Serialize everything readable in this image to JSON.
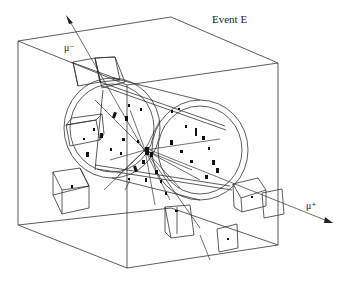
{
  "figure": {
    "title": "Event E",
    "labels": {
      "mu_minus": "μ⁻",
      "mu_plus": "μ⁺"
    },
    "colors": {
      "line": "#333333",
      "hit": "#111111",
      "background": "#ffffff"
    }
  }
}
